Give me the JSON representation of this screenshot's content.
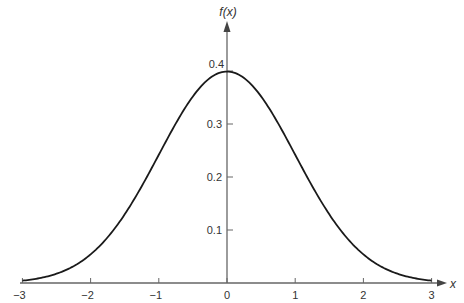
{
  "chart_data": {
    "type": "line",
    "title": "",
    "xlabel": "x",
    "ylabel": "f(x)",
    "xlim": [
      -3,
      3
    ],
    "ylim": [
      0,
      0.4
    ],
    "grid": false,
    "legend": null,
    "x_ticks": [
      "−3",
      "−2",
      "−1",
      "0",
      "1",
      "2",
      "3"
    ],
    "y_ticks": [
      "0.1",
      "0.2",
      "0.3",
      "0.4"
    ],
    "series": [
      {
        "name": "standard normal density",
        "x": [
          -3,
          -2.5,
          -2,
          -1.5,
          -1,
          -0.5,
          0,
          0.5,
          1,
          1.5,
          2,
          2.5,
          3
        ],
        "y": [
          0.004,
          0.018,
          0.054,
          0.13,
          0.242,
          0.352,
          0.399,
          0.352,
          0.242,
          0.13,
          0.054,
          0.018,
          0.004
        ]
      }
    ],
    "colors": {
      "curve": "#1a1a1a",
      "axis": "#555555"
    }
  }
}
